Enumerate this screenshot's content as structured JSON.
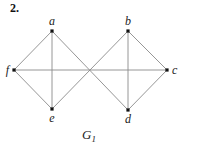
{
  "problem_number": "2.",
  "graph": {
    "name": "G",
    "name_subscript": "1",
    "vertices": [
      {
        "id": "a",
        "label": "a"
      },
      {
        "id": "b",
        "label": "b"
      },
      {
        "id": "c",
        "label": "c"
      },
      {
        "id": "d",
        "label": "d"
      },
      {
        "id": "e",
        "label": "e"
      },
      {
        "id": "f",
        "label": "f"
      }
    ],
    "edges": [
      [
        "a",
        "f"
      ],
      [
        "a",
        "e"
      ],
      [
        "a",
        "d"
      ],
      [
        "f",
        "e"
      ],
      [
        "f",
        "c"
      ],
      [
        "e",
        "b"
      ],
      [
        "b",
        "c"
      ],
      [
        "b",
        "d"
      ],
      [
        "c",
        "d"
      ]
    ]
  }
}
